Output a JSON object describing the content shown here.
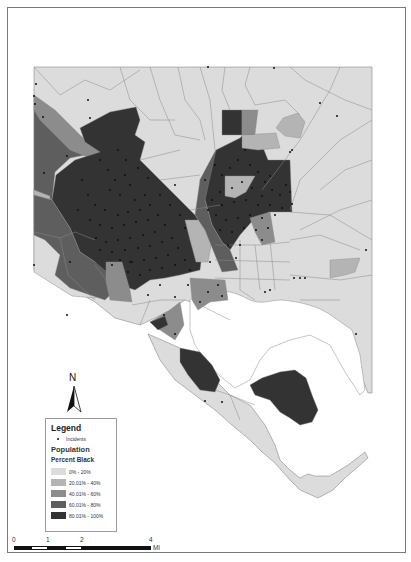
{
  "map": {
    "title": "Baltimore City - Incidents and Percent Black Population",
    "colors": {
      "class1": "#dcdcdc",
      "class2": "#b4b4b4",
      "class3": "#8c8c8c",
      "class4": "#5e5e5e",
      "class5": "#333333",
      "water": "#ffffff",
      "boundary": "#8a8a8a",
      "incident": "#111111"
    }
  },
  "north_arrow": {
    "label": "N"
  },
  "legend": {
    "title": "Legend",
    "incidents_label": "Incidents",
    "layer_title": "Population",
    "field_title": "Percent Black",
    "classes": [
      {
        "label": "0% - 20%",
        "color": "#dcdcdc"
      },
      {
        "label": "20.01% - 40%",
        "color": "#b4b4b4"
      },
      {
        "label": "40.01% - 60%",
        "color": "#8c8c8c"
      },
      {
        "label": "60.01% - 80%",
        "color": "#5e5e5e"
      },
      {
        "label": "80.01% - 100%",
        "color": "#333333"
      }
    ]
  },
  "scale_bar": {
    "ticks": [
      "0",
      "1",
      "2",
      "4"
    ],
    "unit": "Mi"
  }
}
